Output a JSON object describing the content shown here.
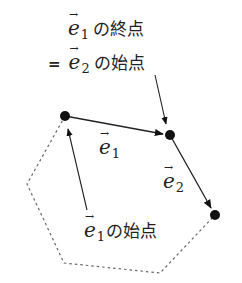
{
  "diagram": {
    "colors": {
      "stroke": "#222222",
      "dashed": "#666666",
      "text": "#222222",
      "background": "#ffffff"
    },
    "points": {
      "p1": {
        "x": 65,
        "y": 116
      },
      "p2": {
        "x": 170,
        "y": 135
      },
      "p3": {
        "x": 215,
        "y": 215
      }
    },
    "dashed_polygon": [
      [
        65,
        116
      ],
      [
        27,
        184
      ],
      [
        64,
        263
      ],
      [
        160,
        273
      ],
      [
        215,
        215
      ]
    ],
    "vectors": [
      {
        "name": "e1",
        "symbol": "e",
        "subscript": "1",
        "from": "p1",
        "to": "p2"
      },
      {
        "name": "e2",
        "symbol": "e",
        "subscript": "2",
        "from": "p2",
        "to": "p3"
      }
    ],
    "labels": {
      "top_line1": {
        "symbol": "e",
        "arrow": "→",
        "subscript": "1",
        "text": "の終点"
      },
      "top_line2": {
        "prefix": "=",
        "symbol": "e",
        "arrow": "→",
        "subscript": "2",
        "text": "の始点"
      },
      "e1_label": {
        "symbol": "e",
        "arrow": "→",
        "subscript": "1"
      },
      "e2_label": {
        "symbol": "e",
        "arrow": "→",
        "subscript": "2"
      },
      "bottom_label": {
        "symbol": "e",
        "arrow": "→",
        "subscript": "1",
        "text": "の始点"
      }
    },
    "pointer_arrows": [
      {
        "name": "to-e1-end",
        "from": [
          155,
          75
        ],
        "to": [
          167,
          125
        ]
      },
      {
        "name": "to-e1-start",
        "from": [
          87,
          210
        ],
        "to": [
          68,
          128
        ]
      }
    ]
  }
}
